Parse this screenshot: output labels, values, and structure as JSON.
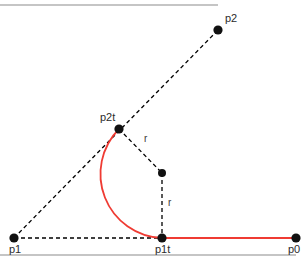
{
  "figure": {
    "title": "",
    "width": 307,
    "height": 263,
    "background": "#ffffff",
    "colors": {
      "curve": "#ef3b33",
      "construction": "#000000",
      "point": "#111111",
      "label": "#2b2b2b",
      "rule": "#8c8c8c"
    },
    "rules": [
      {
        "name": "top-rule",
        "x1": 0,
        "y1": 5,
        "x2": 218,
        "y2": 5
      },
      {
        "name": "bottom-rule",
        "x1": 0,
        "y1": 255,
        "x2": 296,
        "y2": 255
      }
    ],
    "points": [
      {
        "id": "p0",
        "label": "p0",
        "x": 296,
        "y": 238,
        "label_x": 288,
        "label_y": 253,
        "anchor": "start"
      },
      {
        "id": "p1",
        "label": "p1",
        "x": 14,
        "y": 238,
        "label_x": 9,
        "label_y": 253,
        "anchor": "start"
      },
      {
        "id": "p2",
        "label": "p2",
        "x": 218,
        "y": 30,
        "label_x": 225,
        "label_y": 22,
        "anchor": "start"
      },
      {
        "id": "p1t",
        "label": "p1t",
        "x": 162,
        "y": 238,
        "label_x": 155,
        "label_y": 253,
        "anchor": "start"
      },
      {
        "id": "p2t",
        "label": "p2t",
        "x": 119,
        "y": 129,
        "label_x": 100,
        "label_y": 121,
        "anchor": "start"
      },
      {
        "id": "center",
        "label": "",
        "x": 162,
        "y": 173,
        "label_x": 0,
        "label_y": 0,
        "anchor": "start"
      }
    ],
    "radius_labels": [
      {
        "id": "r-upper",
        "text": "r",
        "x": 144,
        "y": 142
      },
      {
        "id": "r-lower",
        "text": "r",
        "x": 168,
        "y": 206
      }
    ],
    "dashed_lines": [
      {
        "id": "p1-to-p2",
        "x1": 14,
        "y1": 238,
        "x2": 218,
        "y2": 30
      },
      {
        "id": "p1-to-p1t",
        "x1": 14,
        "y1": 238,
        "x2": 162,
        "y2": 238
      },
      {
        "id": "p2t-to-center",
        "x1": 119,
        "y1": 129,
        "x2": 162,
        "y2": 173
      },
      {
        "id": "center-to-p1t",
        "x1": 162,
        "y1": 173,
        "x2": 162,
        "y2": 238
      }
    ],
    "red_segment": {
      "id": "p1t-to-p0",
      "x1": 162,
      "y1": 238,
      "x2": 296,
      "y2": 238
    },
    "red_arc": {
      "id": "fillet-arc",
      "start_x": 119,
      "start_y": 129,
      "end_x": 162,
      "end_y": 238,
      "radius": 64,
      "sweep": 0,
      "large_arc": 0,
      "center_x": 162,
      "center_y": 173
    }
  },
  "chart_data": {
    "type": "diagram",
    "labels": [
      "p0",
      "p1",
      "p2",
      "p1t",
      "p2t",
      "r",
      "r"
    ],
    "points": {
      "p0": [
        296,
        238
      ],
      "p1": [
        14,
        238
      ],
      "p2": [
        218,
        30
      ],
      "p1t": [
        162,
        238
      ],
      "p2t": [
        119,
        129
      ],
      "arc_center": [
        162,
        173
      ]
    },
    "radius": 64,
    "legend": [],
    "xlabel": "",
    "ylabel": ""
  }
}
